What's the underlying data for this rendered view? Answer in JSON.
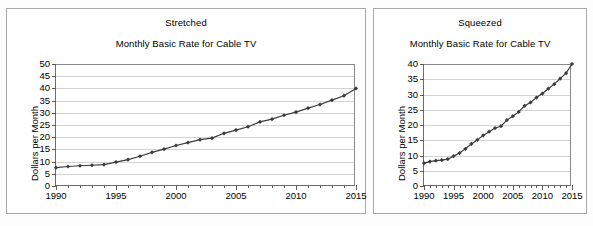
{
  "figure": {
    "panels": [
      {
        "id": "stretched",
        "label": "Stretched",
        "title": "Monthly Basic Rate for Cable TV",
        "ylabel": "Dollars per Month"
      },
      {
        "id": "squeezed",
        "label": "Squeezed",
        "title": "Monthly Basic Rate for Cable TV",
        "ylabel": "Dollars per Month"
      }
    ]
  },
  "chart_data": [
    {
      "type": "line",
      "title": "Monthly Basic Rate for Cable TV",
      "subtitle": "Stretched",
      "xlabel": "",
      "ylabel": "Dollars per Month",
      "x": [
        1990,
        1991,
        1992,
        1993,
        1994,
        1995,
        1996,
        1997,
        1998,
        1999,
        2000,
        2001,
        2002,
        2003,
        2004,
        2005,
        2006,
        2007,
        2008,
        2009,
        2010,
        2011,
        2012,
        2013,
        2014,
        2015
      ],
      "values": [
        7.5,
        8.0,
        8.3,
        8.5,
        8.8,
        9.8,
        10.8,
        12.2,
        13.8,
        15.1,
        16.6,
        17.8,
        19.0,
        19.6,
        21.6,
        22.9,
        24.3,
        26.3,
        27.4,
        29.0,
        30.3,
        31.9,
        33.4,
        35.2,
        37.0,
        40.0
      ],
      "xlim": [
        1990,
        2015
      ],
      "ylim": [
        0,
        50
      ],
      "yticks": [
        0,
        5,
        10,
        15,
        20,
        25,
        30,
        35,
        40,
        45,
        50
      ],
      "xticks": [
        1990,
        1995,
        2000,
        2005,
        2010,
        2015
      ],
      "x_minor_tick_step": 1,
      "grid": "horizontal",
      "legend": "none",
      "marker": "diamond",
      "line_color": "#3b3b3b",
      "grid_color": "#d2d2d2"
    },
    {
      "type": "line",
      "title": "Monthly Basic Rate for Cable TV",
      "subtitle": "Squeezed",
      "xlabel": "",
      "ylabel": "Dollars per Month",
      "x": [
        1990,
        1991,
        1992,
        1993,
        1994,
        1995,
        1996,
        1997,
        1998,
        1999,
        2000,
        2001,
        2002,
        2003,
        2004,
        2005,
        2006,
        2007,
        2008,
        2009,
        2010,
        2011,
        2012,
        2013,
        2014,
        2015
      ],
      "values": [
        7.5,
        8.0,
        8.3,
        8.5,
        8.8,
        9.8,
        10.8,
        12.2,
        13.8,
        15.1,
        16.6,
        17.8,
        19.0,
        19.6,
        21.6,
        22.9,
        24.3,
        26.3,
        27.4,
        29.0,
        30.3,
        31.9,
        33.4,
        35.2,
        37.0,
        40.0
      ],
      "xlim": [
        1990,
        2015
      ],
      "ylim": [
        0,
        40
      ],
      "yticks": [
        0,
        5,
        10,
        15,
        20,
        25,
        30,
        35,
        40
      ],
      "xticks": [
        1990,
        1995,
        2000,
        2005,
        2010,
        2015
      ],
      "x_minor_tick_step": 1,
      "grid": "horizontal",
      "legend": "none",
      "marker": "diamond",
      "line_color": "#3b3b3b",
      "grid_color": "#d2d2d2"
    }
  ]
}
